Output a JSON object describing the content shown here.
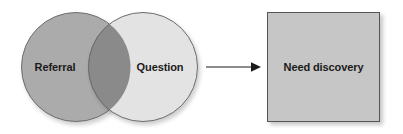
{
  "diagram": {
    "type": "venn-to-outcome-flow",
    "venn": {
      "left_circle": {
        "label": "Referral",
        "fill": "#ababab",
        "stroke": "#6d6d6d"
      },
      "right_circle": {
        "label": "Question",
        "fill": "#e3e3e3",
        "stroke": "#6d6d6d"
      },
      "overlap": {
        "fill": "#8a8a8a",
        "stroke": "#6d6d6d"
      }
    },
    "connector": {
      "icon": "arrow-right-icon",
      "color": "#1b1b1b"
    },
    "outcome": {
      "label": "Need discovery",
      "fill": "#c6c6c6",
      "stroke": "#555555"
    },
    "background": "#ffffff",
    "text_color": "#1b1b1b"
  }
}
